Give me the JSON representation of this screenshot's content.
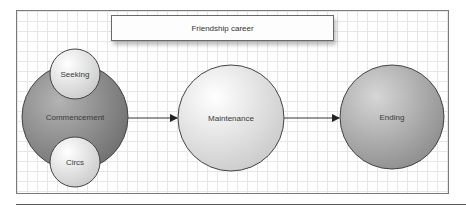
{
  "title": "Friendship career",
  "nodes": {
    "commencement": {
      "label": "Commencement",
      "fill": "#8f8f8f"
    },
    "seeking": {
      "label": "Seeking",
      "fill": "#e2e2e2"
    },
    "circs": {
      "label": "Circs",
      "fill": "#e2e2e2"
    },
    "maintenance": {
      "label": "Maintenance",
      "fill": "#e4e4e4"
    },
    "ending": {
      "label": "Ending",
      "fill": "#a6a6a6"
    }
  },
  "edges": [
    {
      "from": "Commencement",
      "to": "Maintenance"
    },
    {
      "from": "Maintenance",
      "to": "Ending"
    }
  ]
}
